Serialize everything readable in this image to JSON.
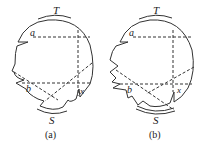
{
  "panels": [
    {
      "id": "a",
      "caption": "(a)",
      "labels": {
        "top": "T",
        "bottom": "S",
        "point_upper": "a",
        "point_lower": "b",
        "point_right": "x"
      }
    },
    {
      "id": "b",
      "caption": "(b)",
      "labels": {
        "top": "T",
        "bottom": "S",
        "point_upper": "a",
        "point_lower": "b",
        "point_right": "x"
      }
    }
  ],
  "colors": {
    "stroke": "#333333",
    "background": "#ffffff"
  }
}
